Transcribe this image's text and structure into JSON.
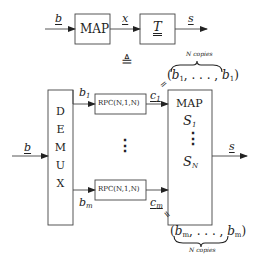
{
  "top_chain": {
    "input_label": "b",
    "map_box_label": "MAP",
    "mid_label": "x",
    "t_box_label": "T",
    "output_label": "s"
  },
  "equivalence_symbol": "≜",
  "bottom_system": {
    "input_label": "b",
    "demux_box": {
      "letters": [
        "D",
        "E",
        "M",
        "U",
        "X"
      ]
    },
    "branches": [
      {
        "in_label": "b",
        "in_sub": "1",
        "rpc_label": "RPC(N,1,N)",
        "out_label": "c",
        "out_sub": "1"
      },
      {
        "in_label": "b",
        "in_sub": "m",
        "rpc_label": "RPC(N,1,N)",
        "out_label": "c",
        "out_sub": "m"
      }
    ],
    "middle_dots": "⋮",
    "map_box": {
      "title": "MAP",
      "first": "S",
      "first_sub": "1",
      "dots": "⋮",
      "last": "S",
      "last_sub": "N"
    },
    "output_label": "s",
    "top_annotation": {
      "equals": "=",
      "copies_label": "N copies",
      "tuple_open": "(",
      "tuple_first": "b",
      "tuple_first_sub": "1",
      "tuple_middle": ", . . . , ",
      "tuple_last": "b",
      "tuple_last_sub": "1",
      "tuple_close": ")"
    },
    "bottom_annotation": {
      "equals": "=",
      "copies_label": "N copies",
      "tuple_open": "(",
      "tuple_first": "b",
      "tuple_first_sub": "m",
      "tuple_middle": ", . . . , ",
      "tuple_last": "b",
      "tuple_last_sub": "m",
      "tuple_close": ")"
    }
  }
}
